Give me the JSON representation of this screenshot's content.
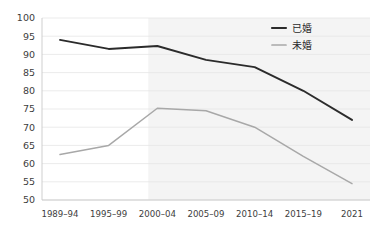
{
  "chart_data": {
    "type": "line",
    "title": "",
    "xlabel": "",
    "ylabel": "",
    "categories": [
      "1989–94",
      "1995–99",
      "2000–04",
      "2005–09",
      "2010–14",
      "2015–19",
      "2021"
    ],
    "ylim": [
      50,
      100
    ],
    "yticks": [
      50,
      55,
      60,
      65,
      70,
      75,
      80,
      85,
      90,
      95,
      100
    ],
    "ytick_labels": [
      "50",
      "55",
      "60",
      "65",
      "70",
      "75",
      "80",
      "85",
      "90",
      "95",
      "100"
    ],
    "grid": true,
    "legend_position": "top-right",
    "series": [
      {
        "name": "已婚",
        "color": "#2b2b2b",
        "width": 1.9,
        "values": [
          94.0,
          91.5,
          92.3,
          88.5,
          86.5,
          80.0,
          72.0
        ]
      },
      {
        "name": "未婚",
        "color": "#a8a8a8",
        "width": 1.5,
        "values": [
          62.5,
          65.0,
          75.2,
          74.5,
          70.0,
          62.0,
          54.5
        ]
      }
    ],
    "shaded_region": {
      "from_category_index": 2,
      "to_category_index": 6,
      "color": "#f4f4f4"
    }
  },
  "legend": {
    "items": [
      {
        "label": "已婚",
        "marker": "line-marker-dark"
      },
      {
        "label": "未婚",
        "marker": "line-marker-gray"
      }
    ]
  },
  "colors": {
    "married_line": "#2b2b2b",
    "unmarried_line": "#a8a8a8",
    "gridline": "#e6e6e6",
    "axis": "#c9c9c9",
    "text": "#3d3d3d",
    "background": "#ffffff",
    "shade": "#f4f4f4"
  }
}
